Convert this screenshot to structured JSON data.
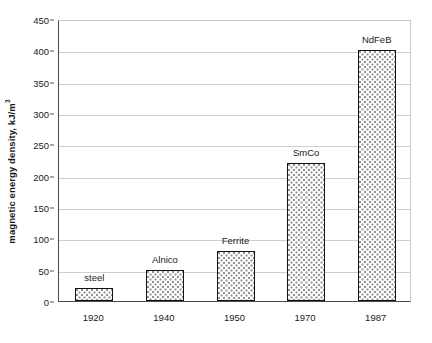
{
  "chart_data": {
    "type": "bar",
    "title": "",
    "subtitle": "",
    "xlabel": "",
    "ylabel": "magnetic energy density, kJ/m",
    "ylabel_superscript": "3",
    "categories": [
      "1920",
      "1940",
      "1950",
      "1970",
      "1987"
    ],
    "point_labels": [
      "steel",
      "Alnico",
      "Ferrite",
      "SmCo",
      "NdFeB"
    ],
    "values": [
      20,
      50,
      80,
      220,
      400
    ],
    "ylim": [
      0,
      450
    ],
    "ytick_values": [
      0,
      50,
      100,
      150,
      200,
      250,
      300,
      350,
      400,
      450
    ],
    "ytick_labels": [
      "0",
      "50",
      "100",
      "150",
      "200",
      "250",
      "300",
      "350",
      "400",
      "450"
    ],
    "grid": "horizontal",
    "legend": "none",
    "series": [
      {
        "name": "magnetic energy density",
        "values": [
          20,
          50,
          80,
          220,
          400
        ]
      }
    ],
    "colors": {
      "bar_fill": "#ffffff",
      "bar_pattern": "#8e8e8e",
      "bar_border": "#121212",
      "gridline": "#cfcfcf",
      "axis": "#4a4a4a",
      "text": "#1a1a1a",
      "background": "#ffffff"
    }
  }
}
